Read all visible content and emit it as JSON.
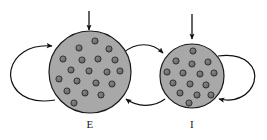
{
  "figure": {
    "type": "diagram",
    "background_color": "#ffffff",
    "width": 267,
    "height": 140
  },
  "style": {
    "population_fill": "#a8a8a8",
    "population_stroke": "#1a1a1a",
    "neuron_fill": "#6e6e6e",
    "neuron_stroke": "#1f1f1f",
    "arrow_color": "#111111",
    "label_color": "#1a1a1a",
    "population_stroke_width": 1.2,
    "neuron_radius": 3.1,
    "arrow_stroke_width": 1.2
  },
  "populations": [
    {
      "id": "E",
      "label": "E",
      "name": "excitatory-population",
      "cx": 90,
      "cy": 72,
      "r": 41,
      "label_x": 90,
      "label_y": 128,
      "neuron_count": 19,
      "neurons": [
        {
          "x": 95,
          "y": 41
        },
        {
          "x": 79,
          "y": 48
        },
        {
          "x": 109,
          "y": 49
        },
        {
          "x": 63,
          "y": 59
        },
        {
          "x": 82,
          "y": 60
        },
        {
          "x": 98,
          "y": 59
        },
        {
          "x": 115,
          "y": 60
        },
        {
          "x": 71,
          "y": 70
        },
        {
          "x": 89,
          "y": 71
        },
        {
          "x": 107,
          "y": 72
        },
        {
          "x": 120,
          "y": 71
        },
        {
          "x": 59,
          "y": 79
        },
        {
          "x": 77,
          "y": 81
        },
        {
          "x": 96,
          "y": 83
        },
        {
          "x": 112,
          "y": 84
        },
        {
          "x": 67,
          "y": 91
        },
        {
          "x": 85,
          "y": 93
        },
        {
          "x": 101,
          "y": 95
        },
        {
          "x": 74,
          "y": 103
        }
      ]
    },
    {
      "id": "I",
      "label": "I",
      "name": "inhibitory-population",
      "cx": 192,
      "cy": 76,
      "r": 32,
      "label_x": 192,
      "label_y": 128,
      "neuron_count": 15,
      "neurons": [
        {
          "x": 193,
          "y": 51
        },
        {
          "x": 176,
          "y": 61
        },
        {
          "x": 192,
          "y": 64
        },
        {
          "x": 208,
          "y": 62
        },
        {
          "x": 167,
          "y": 72
        },
        {
          "x": 183,
          "y": 73
        },
        {
          "x": 200,
          "y": 74
        },
        {
          "x": 214,
          "y": 73
        },
        {
          "x": 173,
          "y": 83
        },
        {
          "x": 190,
          "y": 84
        },
        {
          "x": 206,
          "y": 85
        },
        {
          "x": 180,
          "y": 93
        },
        {
          "x": 197,
          "y": 95
        },
        {
          "x": 211,
          "y": 95
        },
        {
          "x": 189,
          "y": 103
        }
      ]
    }
  ],
  "connections": [
    {
      "id": "input-E",
      "name": "external-input-arrow-E",
      "kind": "input",
      "from": "external",
      "to": "E",
      "description": "vertical external drive arrow into E"
    },
    {
      "id": "input-I",
      "name": "external-input-arrow-I",
      "kind": "input",
      "from": "external",
      "to": "I",
      "description": "vertical external drive arrow into I"
    },
    {
      "id": "E-self",
      "name": "recurrent-loop-E",
      "kind": "self-loop",
      "from": "E",
      "to": "E",
      "description": "E recurrent excitation self-loop on the left"
    },
    {
      "id": "I-self",
      "name": "recurrent-loop-I",
      "kind": "self-loop",
      "from": "I",
      "to": "I",
      "description": "I recurrent inhibition self-loop on the right"
    },
    {
      "id": "E-to-I",
      "name": "connection-e-to-i",
      "kind": "projection",
      "from": "E",
      "to": "I",
      "description": "upper curved arrow from E to I"
    },
    {
      "id": "I-to-E",
      "name": "connection-i-to-e",
      "kind": "projection",
      "from": "I",
      "to": "E",
      "description": "lower curved arrow from I to E"
    }
  ]
}
